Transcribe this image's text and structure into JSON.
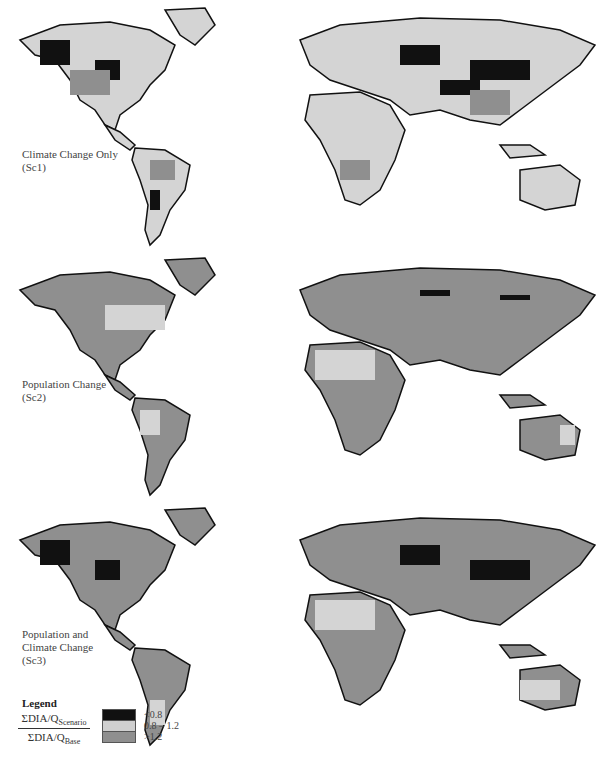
{
  "panels": [
    {
      "label": "Climate Change Only\n(Sc1)",
      "scenario": "Sc1"
    },
    {
      "label": "Population Change\n(Sc2)",
      "scenario": "Sc2"
    },
    {
      "label": "Population and\nClimate Change\n(Sc3)",
      "scenario": "Sc3"
    }
  ],
  "legend": {
    "title": "Legend",
    "numerator": "ΣDIA/Q",
    "numerator_sub": "Scenario",
    "denominator": "ΣDIA/Q",
    "denominator_sub": "Base",
    "classes": [
      {
        "label": "<0.8",
        "color": "#111111"
      },
      {
        "label": "0.8 – 1.2",
        "color": "#cfcfcf"
      },
      {
        "label": ">1.2",
        "color": "#8f8f8f"
      }
    ]
  }
}
